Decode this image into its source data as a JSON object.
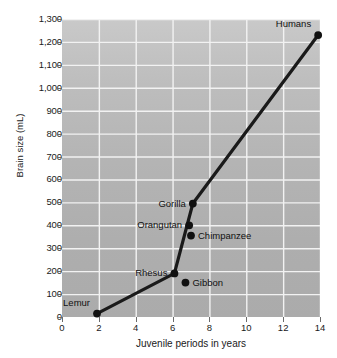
{
  "chart_data": {
    "type": "line",
    "title": "",
    "xlabel": "Juvenile periods in years",
    "ylabel": "Brain size (mL)",
    "xlim": [
      0,
      14
    ],
    "ylim": [
      0,
      1300
    ],
    "xticks": [
      "0",
      "2",
      "4",
      "6",
      "8",
      "10",
      "12",
      "14"
    ],
    "xtick_values": [
      0,
      2,
      4,
      6,
      8,
      10,
      12,
      14
    ],
    "yticks": [
      "0",
      "100",
      "200",
      "300",
      "400",
      "500",
      "600",
      "700",
      "800",
      "900",
      "1,000",
      "1,100",
      "1,200",
      "1,300"
    ],
    "ytick_values": [
      0,
      100,
      200,
      300,
      400,
      500,
      600,
      700,
      800,
      900,
      1000,
      1100,
      1200,
      1300
    ],
    "grid": true,
    "legend": "none",
    "x": [
      1.9,
      6.1,
      6.7,
      6.9,
      7.0,
      7.1,
      13.9
    ],
    "values": [
      15,
      190,
      150,
      400,
      355,
      495,
      1230
    ],
    "points": [
      {
        "name": "Lemur",
        "x": 1.9,
        "y": 15,
        "label_pos": "upper-left"
      },
      {
        "name": "Rhesus",
        "x": 6.1,
        "y": 190,
        "label_pos": "left"
      },
      {
        "name": "Gibbon",
        "x": 6.7,
        "y": 150,
        "label_pos": "right"
      },
      {
        "name": "Orangutan",
        "x": 6.9,
        "y": 400,
        "label_pos": "left"
      },
      {
        "name": "Chimpanzee",
        "x": 7.0,
        "y": 355,
        "label_pos": "right"
      },
      {
        "name": "Gorilla",
        "x": 7.1,
        "y": 495,
        "label_pos": "left"
      },
      {
        "name": "Humans",
        "x": 13.9,
        "y": 1230,
        "label_pos": "upper-left"
      }
    ],
    "line_path": [
      {
        "x": 1.9,
        "y": 15
      },
      {
        "x": 6.1,
        "y": 190
      },
      {
        "x": 7.1,
        "y": 495
      },
      {
        "x": 13.9,
        "y": 1230
      }
    ],
    "colors": {
      "line": "#1a1a1a",
      "marker": "#111111",
      "plot_background_top": "#c9c9c9",
      "plot_background_bottom": "#ababab",
      "gridline": "#f2f2f2",
      "axis": "#6b6b6b",
      "text": "#1a1a1a",
      "page_background": "#ffffff"
    }
  }
}
